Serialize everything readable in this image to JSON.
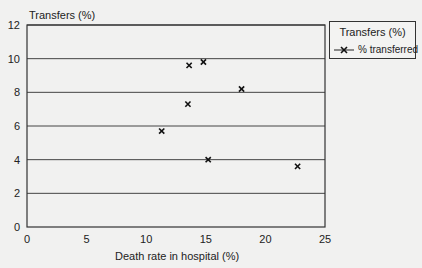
{
  "chart_data": {
    "type": "scatter",
    "title": "",
    "xlabel": "Death rate in hospital (%)",
    "ylabel": "Transfers (%)",
    "xlim": [
      0,
      25
    ],
    "ylim": [
      0,
      12
    ],
    "xticks": [
      0,
      5,
      10,
      15,
      20,
      25
    ],
    "yticks": [
      0,
      2,
      4,
      6,
      8,
      10,
      12
    ],
    "grid": "horizontal",
    "legend_position": "right",
    "legend_title": "Transfers (%)",
    "series": [
      {
        "name": "% transferred",
        "marker": "x",
        "points": [
          {
            "x": 11.3,
            "y": 5.7
          },
          {
            "x": 13.5,
            "y": 7.3
          },
          {
            "x": 13.6,
            "y": 9.6
          },
          {
            "x": 14.8,
            "y": 9.8
          },
          {
            "x": 15.2,
            "y": 4.0
          },
          {
            "x": 18.0,
            "y": 8.2
          },
          {
            "x": 22.7,
            "y": 3.6
          }
        ]
      }
    ]
  },
  "labels": {
    "ylabel": "Transfers (%)",
    "xlabel": "Death rate in hospital (%)",
    "legend_title": "Transfers (%)",
    "legend_entry": "% transferred"
  }
}
